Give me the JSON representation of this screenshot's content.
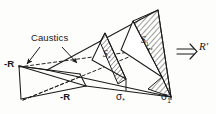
{
  "figure": {
    "ink_color": "#1a1a1a",
    "background_color": "#fdfdfc",
    "labels": {
      "caustics": "Caustics",
      "minus_R_left": "-R",
      "minus_R_mid": "-R",
      "sigma_star_sym": "σ",
      "sigma_star_sub": "*",
      "sigma_one_sym": "σ",
      "sigma_one_sub": "1",
      "S_star_sym": "S",
      "S_star_sub": "*",
      "S_one_sym": "S",
      "S_one_sub": "1",
      "arrow_double": "⇒",
      "vector_R": "R′"
    },
    "annotations": {
      "caustic_arrow_count": 2,
      "cross_sections": [
        "σ*",
        "σ1"
      ],
      "hatched_faces": 2,
      "dashed_rays": 3
    }
  }
}
